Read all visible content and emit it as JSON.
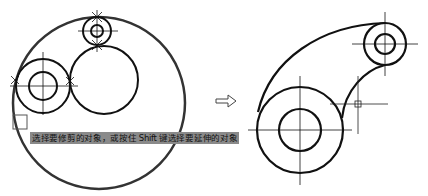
{
  "figure": {
    "left_panel": {
      "label": "before-trim",
      "tooltip_prompt": "选择要修剪的对象，或按住 Shift 键选择要延伸的对象"
    },
    "arrow": {
      "label": "transform-arrow",
      "glyph": "⇨"
    },
    "right_panel": {
      "label": "after-trim"
    }
  },
  "colors": {
    "stroke": "#111111",
    "tooltip_bg": "#8a8a8a",
    "background": "#ffffff"
  }
}
